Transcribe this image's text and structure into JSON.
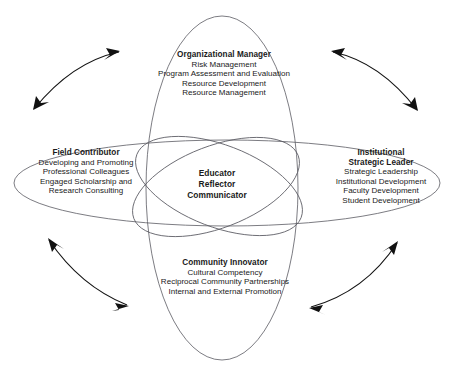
{
  "figure": {
    "caption_partial": "",
    "background_color": "#ffffff",
    "line_color": "#5a5a62",
    "arrow_color": "#111111",
    "text_color": "#1a1a1a"
  },
  "center": {
    "lines": [
      "Educator",
      "Reflector",
      "Communicator"
    ]
  },
  "domains": {
    "top": {
      "title": "Organizational Manager",
      "items": [
        "Risk Management",
        "Program Assessment and Evaluation",
        "Resource Development",
        "Resource Management"
      ]
    },
    "left": {
      "title": "Field Contributor",
      "items": [
        "Developing and Promoting",
        "Professional Colleagues",
        "Engaged Scholarship and",
        "Research Consulting"
      ]
    },
    "right": {
      "title_line1": "Institutional",
      "title_line2": "Strategic Leader",
      "items": [
        "Strategic Leadership",
        "Institutional Development",
        "Faculty Development",
        "Student Development"
      ]
    },
    "bottom": {
      "title": "Community Innovator",
      "items": [
        "Cultural Competency",
        "Reciprocal Community Partnerships",
        "Internal and External Promotion"
      ]
    }
  },
  "arrows": {
    "top_left": "double-headed-curved-arrow",
    "top_right": "double-headed-curved-arrow",
    "bottom_left": "double-headed-curved-arrow",
    "bottom_right": "double-headed-curved-arrow"
  }
}
